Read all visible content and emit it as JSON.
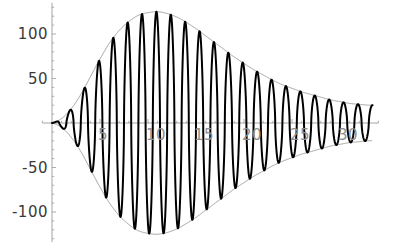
{
  "chart_data": {
    "type": "line",
    "title": "",
    "subtitle": "",
    "xlabel": "",
    "ylabel": "",
    "xlim": [
      -1,
      34
    ],
    "ylim": [
      -135,
      135
    ],
    "grid": false,
    "legend": null,
    "x_ticks": [
      5,
      10,
      15,
      20,
      25,
      30
    ],
    "x_tick_labels": [
      "5",
      "10",
      "15",
      "20",
      "25",
      "30"
    ],
    "y_ticks": [
      100,
      50,
      -50,
      -100
    ],
    "y_tick_labels": [
      "100",
      "50",
      "-50",
      "-100"
    ],
    "y_minor_tick_step": 10,
    "x_minor_tick_step": 1,
    "axis_color": "#9a9a9a",
    "tick_label_color_y": "#3a3a3a",
    "tick_label_color_x": "#8f8f8f",
    "series": [
      {
        "name": "oscillation",
        "color": "#000000",
        "line_width": 2.0,
        "description": "rapidly oscillating sharp-peaked wave filling the envelope",
        "period": 1.5,
        "cycles": 22
      },
      {
        "name": "envelope-upper",
        "color": "#8a8a8a",
        "line_width": 0.8,
        "x": [
          0,
          1,
          2,
          3,
          4,
          5,
          6,
          7,
          8,
          9,
          10,
          11,
          12,
          13,
          14,
          15,
          16,
          17,
          18,
          19,
          20,
          21,
          22,
          23,
          24,
          25,
          26,
          27,
          28,
          29,
          30,
          31,
          32,
          33
        ],
        "y": [
          0,
          5,
          16,
          32,
          52,
          72,
          90,
          104,
          114,
          121,
          124,
          125,
          123,
          119,
          113,
          106,
          98,
          90,
          82,
          74,
          67,
          60,
          54,
          48,
          43,
          39,
          35,
          32,
          29,
          26,
          24,
          22,
          21,
          20
        ]
      },
      {
        "name": "envelope-lower",
        "color": "#8a8a8a",
        "line_width": 0.8,
        "x": [
          0,
          1,
          2,
          3,
          4,
          5,
          6,
          7,
          8,
          9,
          10,
          11,
          12,
          13,
          14,
          15,
          16,
          17,
          18,
          19,
          20,
          21,
          22,
          23,
          24,
          25,
          26,
          27,
          28,
          29,
          30,
          31,
          32,
          33
        ],
        "y": [
          0,
          -5,
          -16,
          -32,
          -52,
          -72,
          -90,
          -104,
          -114,
          -121,
          -124,
          -125,
          -123,
          -119,
          -113,
          -106,
          -98,
          -90,
          -82,
          -74,
          -67,
          -60,
          -54,
          -48,
          -43,
          -39,
          -35,
          -32,
          -29,
          -26,
          -24,
          -22,
          -21,
          -20
        ]
      }
    ]
  }
}
